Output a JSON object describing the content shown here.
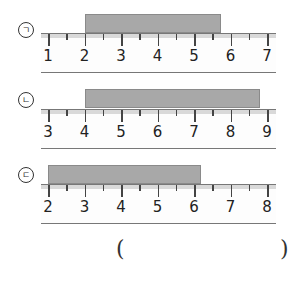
{
  "problems": [
    {
      "label": "㉠",
      "ruler_start": 1,
      "ruler_end": 7,
      "bar_start": 2,
      "bar_end": 5.75
    },
    {
      "label": "㉡",
      "ruler_start": 3,
      "ruler_end": 9,
      "bar_start": 4,
      "bar_end": 8.8
    },
    {
      "label": "㉢",
      "ruler_start": 2,
      "ruler_end": 8,
      "bar_start": 2,
      "bar_end": 6.2
    }
  ],
  "answer": {
    "open": "(",
    "close": ")"
  }
}
